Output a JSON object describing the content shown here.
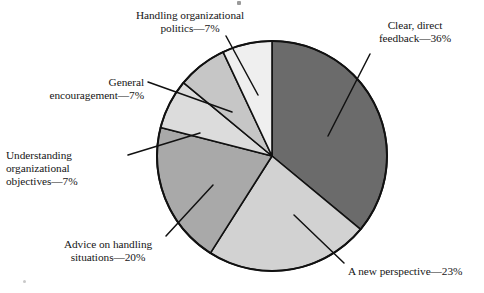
{
  "chart_data": {
    "type": "pie",
    "title": "",
    "xlabel": "",
    "ylabel": "",
    "legend_position": "callout-labels",
    "grid": false,
    "total_percent": 100,
    "start_angle_deg": 0,
    "direction": "clockwise",
    "categories": [
      "Clear, direct feedback",
      "A new perspective",
      "Advice on handling situations",
      "Understanding organizational objectives",
      "General encouragement",
      "Handling organizational politics"
    ],
    "values": [
      36,
      23,
      20,
      7,
      7,
      7
    ],
    "slices": [
      {
        "name": "clear-direct-feedback",
        "label_line_1": "Clear, direct",
        "label_line_2": "feedback—36%",
        "label_full": "Clear, direct feedback—36%",
        "percent": 36,
        "percent_text": "36%",
        "color": "#6b6b6b",
        "start_deg": 0,
        "end_deg": 129.6
      },
      {
        "name": "a-new-perspective",
        "label_line_1": "A new perspective—23%",
        "label_line_2": "",
        "label_full": "A new perspective—23%",
        "percent": 23,
        "percent_text": "23%",
        "color": "#d2d2d2",
        "start_deg": 129.6,
        "end_deg": 212.4
      },
      {
        "name": "advice-on-handling-situations",
        "label_line_1": "Advice on handling",
        "label_line_2": "situations—20%",
        "label_full": "Advice on handling situations—20%",
        "percent": 20,
        "percent_text": "20%",
        "color": "#a9a9a9",
        "start_deg": 212.4,
        "end_deg": 284.4
      },
      {
        "name": "understanding-organizational-objectives",
        "label_line_1": "Understanding",
        "label_line_2": "organizational",
        "label_line_3": "objectives—7%",
        "label_full": "Understanding organizational objectives—7%",
        "percent": 7,
        "percent_text": "7%",
        "color": "#dcdcdc",
        "start_deg": 284.4,
        "end_deg": 309.6
      },
      {
        "name": "general-encouragement",
        "label_line_1": "General",
        "label_line_2": "encouragement—7%",
        "label_full": "General encouragement—7%",
        "percent": 7,
        "percent_text": "7%",
        "color": "#c6c6c6",
        "start_deg": 309.6,
        "end_deg": 334.8
      },
      {
        "name": "handling-organizational-politics",
        "label_line_1": "Handling organizational",
        "label_line_2": "politics—7%",
        "label_full": "Handling organizational politics—7%",
        "percent": 7,
        "percent_text": "7%",
        "color": "#efefef",
        "start_deg": 334.8,
        "end_deg": 360
      }
    ],
    "geometry": {
      "center_x": 272,
      "center_y": 156,
      "radius": 115,
      "outline_color": "#111111",
      "outline_width": 2
    }
  }
}
